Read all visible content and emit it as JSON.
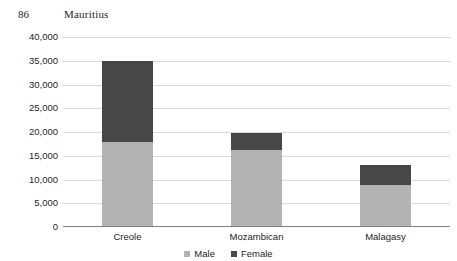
{
  "running_head": {
    "folio": "86",
    "title": "Mauritius"
  },
  "chart_data": {
    "type": "bar",
    "subtype": "stacked-vertical",
    "title": "",
    "xlabel": "",
    "ylabel": "",
    "categories": [
      "Creole",
      "Mozambican",
      "Malagasy"
    ],
    "series": [
      {
        "name": "Male",
        "color": "#b3b3b3",
        "values": [
          17700,
          16000,
          8600
        ]
      },
      {
        "name": "Female",
        "color": "#474747",
        "values": [
          17100,
          3600,
          4200
        ]
      }
    ],
    "totals": [
      34800,
      19600,
      12800
    ],
    "ylim": [
      0,
      40000
    ],
    "ytick_step": 5000,
    "ytick_labels": [
      "40,000",
      "35,000",
      "30,000",
      "25,000",
      "20,000",
      "15,000",
      "10,000",
      "5,000",
      "0"
    ],
    "ytick_values": [
      40000,
      35000,
      30000,
      25000,
      20000,
      15000,
      10000,
      5000,
      0
    ],
    "grid": true,
    "grid_color": "#d9d9d9",
    "axis_color": "#808080",
    "legend": {
      "position": "bottom",
      "entries": [
        {
          "label": "Male",
          "color": "#b3b3b3"
        },
        {
          "label": "Female",
          "color": "#474747"
        }
      ]
    }
  }
}
